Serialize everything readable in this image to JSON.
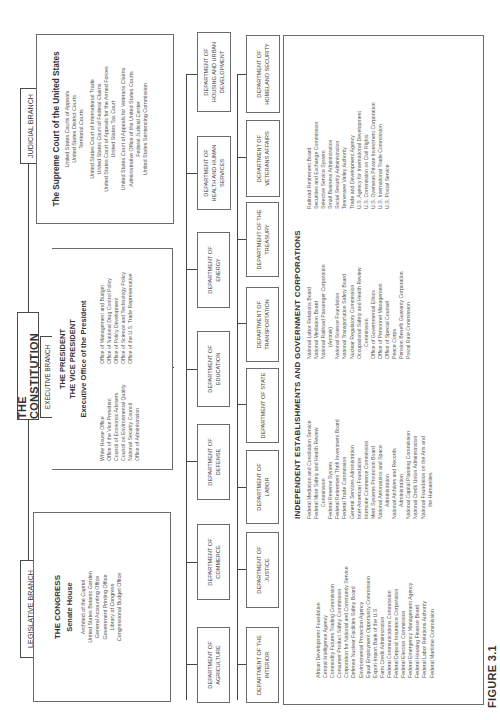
{
  "figure_label": "FIGURE 3.1",
  "constitution": {
    "label": "THE CONSTITUTION"
  },
  "legislative": {
    "label": "LEGISLATIVE BRANCH",
    "title": "THE  CONGRESS",
    "subtitle": "Senate House",
    "items": [
      "Architect of the Capitol",
      "United States Botanic Garden",
      "General Accounting Office",
      "Government Printing Office",
      "Library of Congress",
      "Congressional Budget Office"
    ]
  },
  "executive": {
    "label": "EXECUTIVE BRANCH",
    "president": "THE PRESIDENT",
    "vice_president": "THE VICE PRESIDENT",
    "eop_title": "Executive  Office  of  the  President",
    "left_items": [
      "White House Office",
      "Office of the Vice President",
      "Council of Economic Advisers",
      "Council on Environmental Quality",
      "National Security Council",
      "Office of Administration"
    ],
    "right_items": [
      "Office of Management and Budget",
      "Office of National Drug Control Policy",
      "Office of Policy Development",
      "Office of Science and Technology Policy",
      "Office of the U.S. Trade Representative"
    ]
  },
  "judicial": {
    "label": "JUDICIAL BRANCH",
    "title": "The Supreme Court of the United States",
    "items": [
      "United States Courts of Appeals",
      "United States District Courts",
      "Territorial Courts",
      "United States Court of International Trade",
      "United States Court of Federal Claims",
      "United States Court of Appeals for the Armed Forces",
      "United States Tax Court",
      "United States Court of Appeals for Veterans Claims",
      "Administrative Office of the United States Courts",
      "Federal Judicial Center",
      "United States Sentencing Commission"
    ]
  },
  "departments_row1": [
    "DEPARTMENT OF AGRICULTURE",
    "DEPARTMENT OF COMMERCE",
    "DEPARTMENT OF DEFENSE",
    "DEPARTMENT OF EDUCATION",
    "DEPARTMENT OF ENERGY",
    "DEPARTMENT OF HEALTH AND HUMAN SERVICES",
    "DEPARTMENT OF HOUSING AND URBAN DEVELOPMENT"
  ],
  "departments_row2": [
    "DEPARTMENT OF THE INTERIOR",
    "DEPARTMENT OF JUSTICE",
    "DEPARTMENT OF LABOR",
    "DEPARTMENT OF STATE",
    "DEPARTMENT OF TRANSPORTATION",
    "DEPARTMENT OF THE TREASURY",
    "DEPARTMENT OF VETERANS AFFAIRS",
    "DEPARTMENT OF HOMELAND SECURITY"
  ],
  "independent": {
    "title": "INDEPENDENT ESTABLISHMENTS AND GOVERNMENT CORPORATIONS",
    "col1": [
      "African Development Foundation",
      "Central Intelligence Agency",
      "Commodity Futures Trading Commission",
      "Consumer Product Safety Commission",
      "Corporation for National and Community Service",
      "Defense Nuclear Facilities Safety Board",
      "Environmental Protection Agency",
      "Equal Employment Opportunity Commission",
      "Export-Import Bank of the U.S.",
      "Farm Credit Administration",
      "Federal Communications Commission",
      "Federal Deposit Insurance Corporation",
      "Federal Election Commission",
      "Federal Emergency Management Agency",
      "Federal Housing Finance Board",
      "Federal Labor Relations Authority",
      "Federal Maritime Commission"
    ],
    "col2": [
      "Federal Mediation and Conciliation Service",
      "Federal Mine Safety and Health Review",
      "  Commission",
      "Federal Reserve System",
      "Federal Retirement Thrift Investment Board",
      "Federal Trade Commission",
      "General Services Administration",
      "Inter-American Foundation",
      "Interstate Commerce Commission",
      "Merit Systems Protection Board",
      "National Aeronautics and Space",
      "  Administration",
      "National Archives and Records",
      "  Administration",
      "National Capital Planning Commission",
      "National Credit Union Administration",
      "National Foundation on the Arts and",
      "  the Humanities"
    ],
    "col3": [
      "National Labor Relations Board",
      "National Mediation Board",
      "National Railroad Passenger Corporation",
      "  (Amtrak)",
      "National Science Foundation",
      "National Transportation Safety Board",
      "Nuclear Regulatory Commission",
      "Occupational Safety and Health Review",
      "  Commission",
      "Office of Governmental Ethics",
      "Office of Personnel Management",
      "Office of Special Counsel",
      "Peace Corps",
      "Pension Benefit Guaranty Corporation",
      "Postal Rate Commission"
    ],
    "col4": [
      "Railroad Retirement Board",
      "Securities and Exchange Commission",
      "Selective Service System",
      "Small Business Administration",
      "Social Security Administration",
      "Tennessee Valley Authority",
      "Trade and Development Agency",
      "U.S. Agency for International Development",
      "U.S. Commission on Civil Rights",
      "U.S. Overseas Private Investment Corporation",
      "U.S. International Trade Commission",
      "U.S. Postal Service"
    ]
  }
}
